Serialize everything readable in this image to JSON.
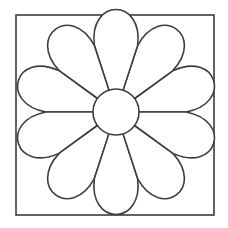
{
  "diagram": {
    "background": "#ffffff",
    "stroke_color": "#3d3d3d",
    "stroke_width": 1.6,
    "frame": {
      "x1": 16,
      "y1": 15,
      "x2": 214,
      "y2": 215
    },
    "flower": {
      "cx": 116,
      "cy": 112,
      "petal_count": 10,
      "inner_radius": 23,
      "divider_radius": 70,
      "outer_radius": 86,
      "divider_start_angle_deg": 0
    }
  }
}
